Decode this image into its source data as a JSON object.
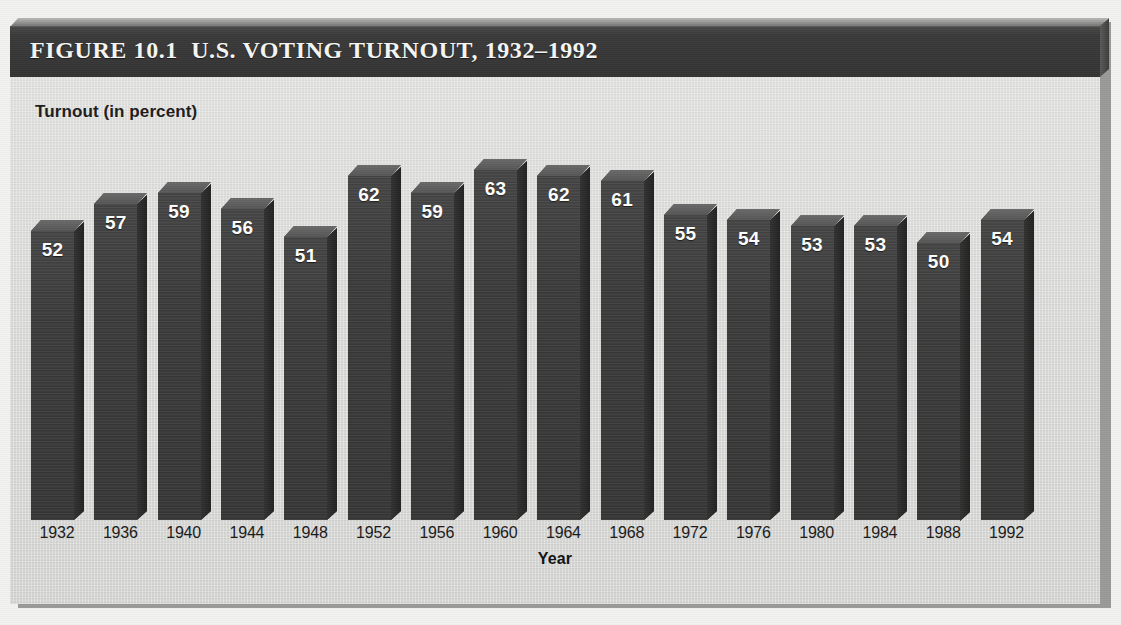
{
  "figure": {
    "title": "FIGURE 10.1  U.S. VOTING TURNOUT, 1932–1992",
    "header_color": "#3b3b3b",
    "panel_color": "#dedede",
    "bar_color": "#3e3e3e",
    "value_label_color": "#ffffff"
  },
  "chart_data": {
    "type": "bar",
    "title": "FIGURE 10.1  U.S. VOTING TURNOUT, 1932–1992",
    "xlabel": "Year",
    "ylabel": "Turnout (in percent)",
    "ylim": [
      0,
      70
    ],
    "grid": false,
    "legend": false,
    "style": "3d-column",
    "categories": [
      "1932",
      "1936",
      "1940",
      "1944",
      "1948",
      "1952",
      "1956",
      "1960",
      "1964",
      "1968",
      "1972",
      "1976",
      "1980",
      "1984",
      "1988",
      "1992"
    ],
    "values": [
      52,
      57,
      59,
      56,
      51,
      62,
      59,
      63,
      62,
      61,
      55,
      54,
      53,
      53,
      50,
      54
    ],
    "series": [
      {
        "name": "Turnout (in percent)",
        "values": [
          52,
          57,
          59,
          56,
          51,
          62,
          59,
          63,
          62,
          61,
          55,
          54,
          53,
          53,
          50,
          54
        ]
      }
    ],
    "data_labels": [
      "52",
      "57",
      "59",
      "56",
      "51",
      "62",
      "59",
      "63",
      "62",
      "61",
      "55",
      "54",
      "53",
      "53",
      "50",
      "54"
    ]
  }
}
